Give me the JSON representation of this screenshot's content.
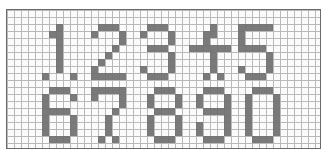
{
  "grid": {
    "columns": 45,
    "rows": 20
  },
  "ink_color": "#6f6f6f",
  "grid_color": "#b9b9b9",
  "digits": [
    {
      "label": "1",
      "col": 5,
      "row": 2,
      "bitmap": [
        "..#..",
        ".##..",
        "..#..",
        "..#..",
        "..#..",
        "..#..",
        "..#..",
        "#...#"
      ]
    },
    {
      "label": "2",
      "col": 12,
      "row": 2,
      "bitmap": [
        ".###.",
        "#...#",
        "....#",
        "...#.",
        "..#..",
        ".#...",
        "#....",
        "#####"
      ]
    },
    {
      "label": "3",
      "col": 19,
      "row": 2,
      "bitmap": [
        ".###.",
        "#...#",
        "....#",
        ".###.",
        "....#",
        "....#",
        "#...#",
        ".###."
      ]
    },
    {
      "label": "4",
      "col": 26,
      "row": 2,
      "bitmap": [
        "...#..",
        "..##..",
        "..#...",
        "######",
        "...#..",
        "...#..",
        "...#..",
        "..#.#."
      ]
    },
    {
      "label": "5",
      "col": 33,
      "row": 2,
      "bitmap": [
        "#####",
        "#....",
        "#....",
        "####.",
        "....#",
        "....#",
        "#...#",
        ".###."
      ]
    },
    {
      "label": "6",
      "col": 5,
      "row": 11,
      "bitmap": [
        ".###.",
        "#...#",
        "#....",
        "####.",
        "#...#",
        "#...#",
        "#...#",
        ".###."
      ]
    },
    {
      "label": "7",
      "col": 12,
      "row": 11,
      "bitmap": [
        "#####",
        "#...#",
        "....#",
        "...#.",
        "..#..",
        "..#..",
        "..#..",
        ".#.#."
      ]
    },
    {
      "label": "8",
      "col": 20,
      "row": 11,
      "bitmap": [
        ".###.",
        "#...#",
        "#...#",
        ".###.",
        "#...#",
        "#...#",
        "#...#",
        ".###."
      ]
    },
    {
      "label": "9",
      "col": 27,
      "row": 11,
      "bitmap": [
        ".###.",
        "#...#",
        "#...#",
        ".####",
        "....#",
        "#...#",
        "#...#",
        ".###."
      ]
    },
    {
      "label": "0",
      "col": 34,
      "row": 11,
      "bitmap": [
        ".###.",
        "#...#",
        "#...#",
        "#...#",
        "#...#",
        "#...#",
        "#...#",
        ".###."
      ]
    }
  ]
}
